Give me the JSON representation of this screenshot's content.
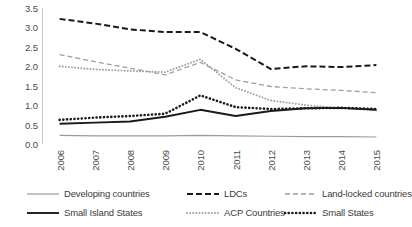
{
  "chart_data": {
    "type": "line",
    "title": "",
    "subtitle": "",
    "xlabel": "",
    "ylabel": "",
    "categories": [
      "2006",
      "2007",
      "2008",
      "2009",
      "2010",
      "2011",
      "2012",
      "2013",
      "2014",
      "2015"
    ],
    "x": [
      2006,
      2007,
      2008,
      2009,
      2010,
      2011,
      2012,
      2013,
      2014,
      2015
    ],
    "ylim": [
      0.0,
      3.5
    ],
    "yticks": [
      "0.0",
      "0.5",
      "1.0",
      "1.5",
      "2.0",
      "2.5",
      "3.0",
      "3.5"
    ],
    "ytick_values": [
      0.0,
      0.5,
      1.0,
      1.5,
      2.0,
      2.5,
      3.0,
      3.5
    ],
    "grid": false,
    "legend_position": "bottom",
    "series": [
      {
        "name": "Developing countries",
        "style": "solid-thin-gray",
        "color": "#9b9b9b",
        "values": [
          0.22,
          0.21,
          0.21,
          0.21,
          0.22,
          0.21,
          0.2,
          0.19,
          0.19,
          0.18
        ]
      },
      {
        "name": "LDCs",
        "style": "dashed-bold",
        "color": "#1a1a1a",
        "values": [
          3.22,
          3.1,
          2.95,
          2.88,
          2.88,
          2.45,
          1.93,
          2.0,
          1.98,
          2.03
        ]
      },
      {
        "name": "Land-locked countries",
        "style": "dashed-thin-gray",
        "color": "#a0a0a0",
        "values": [
          2.3,
          2.12,
          1.95,
          1.78,
          2.1,
          1.65,
          1.48,
          1.42,
          1.38,
          1.32
        ]
      },
      {
        "name": "Small Island States",
        "style": "solid-bold",
        "color": "#1a1a1a",
        "values": [
          0.52,
          0.55,
          0.58,
          0.7,
          0.88,
          0.72,
          0.85,
          0.92,
          0.93,
          0.88
        ]
      },
      {
        "name": "ACP Countries",
        "style": "dotted-thin-gray",
        "color": "#a0a0a0",
        "values": [
          2.0,
          1.92,
          1.88,
          1.85,
          2.18,
          1.45,
          1.12,
          1.0,
          0.92,
          0.87
        ]
      },
      {
        "name": "Small States",
        "style": "dotted-bold",
        "color": "#1a1a1a",
        "values": [
          0.62,
          0.68,
          0.72,
          0.78,
          1.25,
          0.95,
          0.9,
          0.92,
          0.93,
          0.9
        ]
      }
    ]
  },
  "legend": {
    "items": [
      {
        "label": "Developing countries",
        "style": "solid-thin-gray"
      },
      {
        "label": "LDCs",
        "style": "dashed-bold"
      },
      {
        "label": "Land-locked countries",
        "style": "dashed-thin-gray"
      },
      {
        "label": "Small Island States",
        "style": "solid-bold"
      },
      {
        "label": "ACP Countries",
        "style": "dotted-thin-gray"
      },
      {
        "label": "Small States",
        "style": "dotted-bold"
      }
    ]
  }
}
